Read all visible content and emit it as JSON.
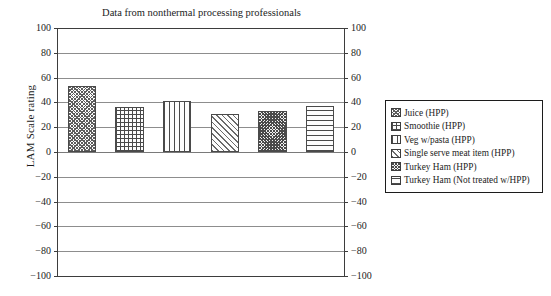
{
  "chart_data": {
    "type": "bar",
    "title": "Data from nonthermal processing professionals",
    "xlabel": "",
    "ylabel": "LAM Scale rating",
    "ylim": [
      -100,
      100
    ],
    "ytick_step": 20,
    "yticks": [
      "100",
      "80",
      "60",
      "40",
      "20",
      "0",
      "-20",
      "-40",
      "-60",
      "-80",
      "-100"
    ],
    "grid": true,
    "legend_position": "right",
    "categories": [
      "Juice (HPP)",
      "Smoothie (HPP)",
      "Veg w/pasta (HPP)",
      "Single serve meat item (HPP)",
      "Turkey Ham (HPP)",
      "Turkey Ham (Not treated w/HPP)"
    ],
    "values": [
      53,
      36,
      41,
      31,
      33,
      37
    ],
    "patterns": [
      "dots",
      "grid",
      "vert",
      "diag",
      "dense",
      "horiz"
    ]
  },
  "legend": {
    "items": [
      {
        "label": "Juice (HPP)",
        "pattern": "dots"
      },
      {
        "label": "Smoothie (HPP)",
        "pattern": "grid"
      },
      {
        "label": "Veg w/pasta (HPP)",
        "pattern": "vert"
      },
      {
        "label": "Single serve meat item (HPP)",
        "pattern": "diag"
      },
      {
        "label": "Turkey Ham (HPP)",
        "pattern": "dense"
      },
      {
        "label": "Turkey Ham (Not treated w/HPP)",
        "pattern": "horiz"
      }
    ]
  },
  "axis": {
    "left_ticks": [
      "100",
      "80",
      "60",
      "40",
      "20",
      "0",
      "-20",
      "-40",
      "-60",
      "-80",
      "-100"
    ],
    "right_ticks": [
      "100",
      "80",
      "60",
      "40",
      "20",
      "0",
      "-20",
      "-40",
      "-60",
      "-80",
      "-100"
    ]
  },
  "colors": {
    "frame": "#3d3d3d",
    "grid": "#8d8d8d",
    "text": "#1c1c1c",
    "hatch": "#4a4a4a",
    "background": "#ffffff"
  }
}
